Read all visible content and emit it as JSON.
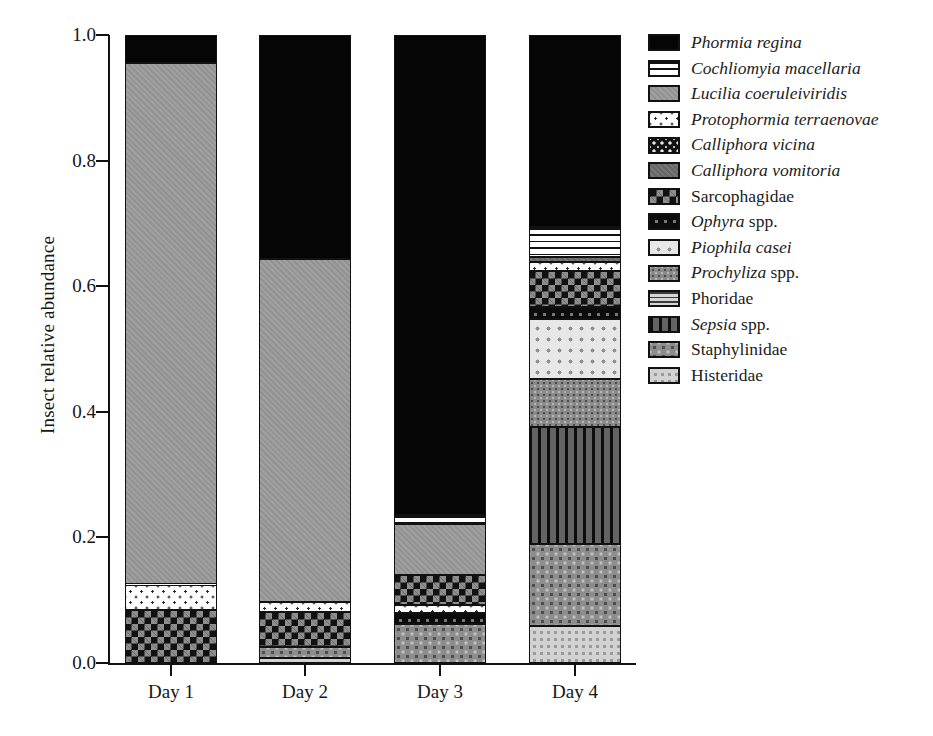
{
  "chart_data": {
    "type": "bar",
    "subtype": "stacked-bar-100-percent",
    "title": "",
    "xlabel": "",
    "ylabel": "Insect relative abundance",
    "ylim": [
      0.0,
      1.0
    ],
    "ytick_labels": [
      "1.0",
      "0.8",
      "0.6",
      "0.4",
      "0.2",
      "0.0"
    ],
    "ytick_values": [
      1.0,
      0.8,
      0.6,
      0.4,
      0.2,
      0.0
    ],
    "grid": false,
    "legend_position": "right",
    "categories": [
      "Day 1",
      "Day 2",
      "Day 3",
      "Day 4"
    ],
    "series": [
      {
        "name": "Phormia regina",
        "italic": true,
        "pattern": "solid-black",
        "values": [
          0.045,
          0.357,
          0.762,
          0.305
        ]
      },
      {
        "name": "Cochliomyia macellaria",
        "italic": true,
        "pattern": "horizontal-stripes",
        "values": [
          0.0,
          0.0,
          0.014,
          0.049
        ]
      },
      {
        "name": "Lucilia coeruleiviridis",
        "italic": true,
        "pattern": "gray-medium",
        "values": [
          0.83,
          0.546,
          0.122,
          0.0
        ]
      },
      {
        "name": "Protophormia terraenovae",
        "italic": true,
        "pattern": "white-with-dots",
        "values": [
          0.041,
          0.016,
          0.014,
          0.014
        ]
      },
      {
        "name": "Calliphora vicina",
        "italic": true,
        "pattern": "dark-speckled",
        "values": [
          0.0,
          0.0,
          0.0,
          0.0
        ]
      },
      {
        "name": "Calliphora vomitoria",
        "italic": true,
        "pattern": "gray-dark",
        "values": [
          0.0,
          0.0,
          0.0,
          0.008
        ]
      },
      {
        "name": "Sarcophagidae",
        "italic": false,
        "pattern": "checkerboard",
        "values": [
          0.084,
          0.056,
          0.047,
          0.057
        ]
      },
      {
        "name": "Ophyra spp.",
        "italic": true,
        "pattern": "black-with-squares",
        "values": [
          0.0,
          0.0,
          0.017,
          0.019
        ]
      },
      {
        "name": "Piophila casei",
        "italic": true,
        "pattern": "light-dots",
        "values": [
          0.0,
          0.0,
          0.0,
          0.096
        ]
      },
      {
        "name": "Prochyliza spp.",
        "italic": true,
        "pattern": "gray-stipple",
        "values": [
          0.0,
          0.0,
          0.0,
          0.076
        ]
      },
      {
        "name": "Phoridae",
        "italic": false,
        "pattern": "horizontal-stripes-gray",
        "values": [
          0.0,
          0.0,
          0.0,
          0.0
        ]
      },
      {
        "name": "Sepsia spp.",
        "italic": true,
        "pattern": "vertical-stripes",
        "values": [
          0.0,
          0.0,
          0.0,
          0.187
        ]
      },
      {
        "name": "Staphylinidae",
        "italic": false,
        "pattern": "gray-dots-mid",
        "values": [
          0.0,
          0.017,
          0.024,
          0.13
        ]
      },
      {
        "name": "Histeridae",
        "italic": false,
        "pattern": "light-gray-dots",
        "values": [
          0.0,
          0.008,
          0.0,
          0.059
        ]
      }
    ],
    "stacks": [
      {
        "category": "Day 1",
        "segments": [
          {
            "name": "Sarcophagidae",
            "pattern": "checkerboard",
            "start": 0.0,
            "end": 0.084
          },
          {
            "name": "Protophormia terraenovae",
            "pattern": "white-with-dots",
            "start": 0.084,
            "end": 0.125
          },
          {
            "name": "Lucilia coeruleiviridis",
            "pattern": "gray-medium",
            "start": 0.125,
            "end": 0.955
          },
          {
            "name": "Phormia regina",
            "pattern": "solid-black",
            "start": 0.955,
            "end": 1.0
          }
        ]
      },
      {
        "category": "Day 2",
        "segments": [
          {
            "name": "Histeridae",
            "pattern": "light-gray-dots",
            "start": 0.0,
            "end": 0.008
          },
          {
            "name": "Staphylinidae",
            "pattern": "gray-dots-mid",
            "start": 0.008,
            "end": 0.025
          },
          {
            "name": "Sarcophagidae",
            "pattern": "checkerboard",
            "start": 0.025,
            "end": 0.081
          },
          {
            "name": "Protophormia terraenovae",
            "pattern": "white-with-dots",
            "start": 0.081,
            "end": 0.097
          },
          {
            "name": "Lucilia coeruleiviridis",
            "pattern": "gray-medium",
            "start": 0.097,
            "end": 0.643
          },
          {
            "name": "Phormia regina",
            "pattern": "solid-black",
            "start": 0.643,
            "end": 1.0
          }
        ]
      },
      {
        "category": "Day 3",
        "segments": [
          {
            "name": "Staphylinidae",
            "pattern": "gray-dots-mid",
            "start": 0.0,
            "end": 0.062
          },
          {
            "name": "Ophyra spp.",
            "pattern": "black-with-squares",
            "start": 0.062,
            "end": 0.079
          },
          {
            "name": "Protophormia terraenovae",
            "pattern": "white-with-dots",
            "start": 0.079,
            "end": 0.093
          },
          {
            "name": "Sarcophagidae",
            "pattern": "checkerboard",
            "start": 0.093,
            "end": 0.14
          },
          {
            "name": "Lucilia coeruleiviridis",
            "pattern": "gray-medium",
            "start": 0.14,
            "end": 0.222
          },
          {
            "name": "Cochliomyia macellaria",
            "pattern": "horizontal-stripes",
            "start": 0.222,
            "end": 0.236
          },
          {
            "name": "Phormia regina",
            "pattern": "solid-black",
            "start": 0.236,
            "end": 1.0
          }
        ]
      },
      {
        "category": "Day 4",
        "segments": [
          {
            "name": "Histeridae",
            "pattern": "light-gray-dots",
            "start": 0.0,
            "end": 0.059
          },
          {
            "name": "Staphylinidae",
            "pattern": "gray-dots-mid",
            "start": 0.059,
            "end": 0.189
          },
          {
            "name": "Sepsia spp.",
            "pattern": "vertical-stripes",
            "start": 0.189,
            "end": 0.376
          },
          {
            "name": "Prochyliza spp.",
            "pattern": "gray-stipple",
            "start": 0.376,
            "end": 0.452
          },
          {
            "name": "Piophila casei",
            "pattern": "light-dots",
            "start": 0.452,
            "end": 0.548
          },
          {
            "name": "Ophyra spp.",
            "pattern": "black-with-squares",
            "start": 0.548,
            "end": 0.567
          },
          {
            "name": "Sarcophagidae",
            "pattern": "checkerboard",
            "start": 0.567,
            "end": 0.624
          },
          {
            "name": "Protophormia terraenovae",
            "pattern": "white-with-dots",
            "start": 0.624,
            "end": 0.638
          },
          {
            "name": "Calliphora vomitoria",
            "pattern": "gray-dark",
            "start": 0.638,
            "end": 0.646
          },
          {
            "name": "Cochliomyia macellaria",
            "pattern": "horizontal-stripes",
            "start": 0.646,
            "end": 0.695
          },
          {
            "name": "Phormia regina",
            "pattern": "solid-black",
            "start": 0.695,
            "end": 1.0
          }
        ]
      }
    ]
  },
  "legend": {
    "items": [
      {
        "label": "Phormia regina",
        "italic_part": "Phormia regina",
        "rest": "",
        "pattern": "solid-black"
      },
      {
        "label": "Cochliomyia macellaria",
        "italic_part": "Cochliomyia macellaria",
        "rest": "",
        "pattern": "horizontal-stripes"
      },
      {
        "label": "Lucilia coeruleiviridis",
        "italic_part": "Lucilia coeruleiviridis",
        "rest": "",
        "pattern": "gray-medium"
      },
      {
        "label": "Protophormia terraenovae",
        "italic_part": "Protophormia terraenovae",
        "rest": "",
        "pattern": "white-with-dots"
      },
      {
        "label": "Calliphora vicina",
        "italic_part": "Calliphora vicina",
        "rest": "",
        "pattern": "dark-speckled"
      },
      {
        "label": "Calliphora vomitoria",
        "italic_part": "Calliphora vomitoria",
        "rest": "",
        "pattern": "gray-dark"
      },
      {
        "label": "Sarcophagidae",
        "italic_part": "",
        "rest": "Sarcophagidae",
        "pattern": "checkerboard"
      },
      {
        "label": "Ophyra spp.",
        "italic_part": "Ophyra",
        "rest": " spp.",
        "pattern": "black-with-squares"
      },
      {
        "label": "Piophila casei",
        "italic_part": "Piophila casei",
        "rest": "",
        "pattern": "light-dots"
      },
      {
        "label": "Prochyliza spp.",
        "italic_part": "Prochyliza",
        "rest": " spp.",
        "pattern": "gray-stipple"
      },
      {
        "label": "Phoridae",
        "italic_part": "",
        "rest": "Phoridae",
        "pattern": "horizontal-stripes-gray"
      },
      {
        "label": "Sepsia spp.",
        "italic_part": "Sepsia",
        "rest": " spp.",
        "pattern": "vertical-stripes"
      },
      {
        "label": "Staphylinidae",
        "italic_part": "",
        "rest": "Staphylinidae",
        "pattern": "gray-dots-mid"
      },
      {
        "label": "Histeridae",
        "italic_part": "",
        "rest": "Histeridae",
        "pattern": "light-gray-dots"
      }
    ]
  },
  "colors": {
    "axis": "#111111",
    "text": "#1a1a1a",
    "background": "#ffffff"
  }
}
